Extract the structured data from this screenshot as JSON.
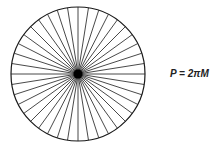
{
  "diagram": {
    "shape": "circle",
    "center": [
      78,
      74
    ],
    "radius": 67,
    "spoke_count": 40,
    "stroke_color": "#1a1a1a",
    "hub_color": "#000000"
  },
  "formula": "P = 2πM"
}
